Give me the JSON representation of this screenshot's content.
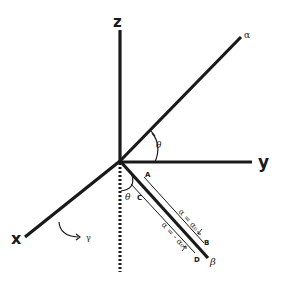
{
  "diagram": {
    "type": "3d-coordinate-axes",
    "axes": {
      "x": {
        "label": "x"
      },
      "y": {
        "label": "y"
      },
      "z": {
        "label": "z"
      }
    },
    "rays": {
      "alpha": {
        "label": "α"
      },
      "beta": {
        "label": "β"
      }
    },
    "angles": {
      "theta_upper": "θ",
      "theta_lower": "θ",
      "gamma": "γ"
    },
    "points": {
      "A": "A",
      "B": "B",
      "C": "C",
      "D": "D"
    },
    "equations": {
      "upper": "α = α₀",
      "lower": "α = - α₀"
    },
    "colors": {
      "ink": "#1a1a1a",
      "background": "#ffffff"
    }
  }
}
